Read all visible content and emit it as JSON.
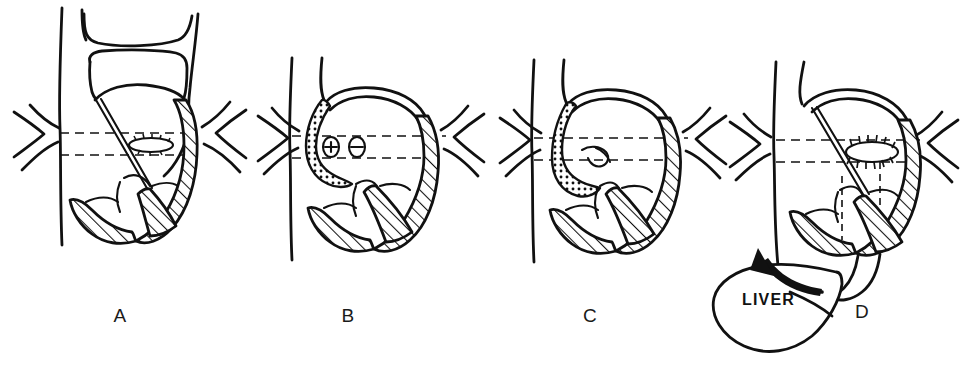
{
  "figure": {
    "type": "medical-surgical-illustration",
    "background_color": "#ffffff",
    "ink_color": "#111111",
    "width": 966,
    "height": 370,
    "panel_count": 4
  },
  "panels": [
    {
      "id": "A",
      "label": "A",
      "label_x": 120,
      "label_y": 322,
      "description": "Esophagus entering hiatus with herniated stomach above diaphragm; hiatal defect shown as small oval, stomach wall cross-hatched",
      "features": [
        "esophagus",
        "diaphragm-chevrons",
        "dashed-hiatus-plane",
        "hiatal-oval-defect",
        "hatched-stomach-wall",
        "herniated-fundus"
      ]
    },
    {
      "id": "B",
      "label": "B",
      "label_x": 348,
      "label_y": 322,
      "description": "Stippled (textured) tube looping through the hiatal plane with two small circular structures shown in the dashed channel",
      "features": [
        "stippled-tube",
        "diaphragm-chevrons",
        "dashed-hiatus-plane",
        "two-small-circles",
        "hatched-stomach-wall"
      ]
    },
    {
      "id": "C",
      "label": "C",
      "label_x": 590,
      "label_y": 322,
      "description": "Stippled tube curled downward, hooked tip visible at the hiatus; stomach wall remains cross-hatched",
      "features": [
        "stippled-tube-curled",
        "hooked-tip",
        "diaphragm-chevrons",
        "dashed-hiatus-plane",
        "hatched-stomach-wall"
      ]
    },
    {
      "id": "D",
      "label": "D",
      "label_x": 862,
      "label_y": 318,
      "description": "Completed repair: sutured hiatus shown as oval with radiating stitch marks, liver retracted away as indicated by the curved arrow",
      "features": [
        "sutured-hiatal-oval",
        "stitch-marks",
        "diaphragm-chevrons",
        "dashed-hiatus-plane",
        "dashed-vertical-guide",
        "hatched-stomach-wall",
        "liver-outline",
        "retraction-arrow"
      ]
    }
  ],
  "annotations": [
    {
      "name": "liver-label",
      "text": "LIVER",
      "x": 742,
      "y": 305,
      "panel": "D"
    }
  ],
  "icons": {
    "retraction_arrow": "curved-arrow-icon",
    "diaphragm_left": "chevron-right-icon",
    "diaphragm_right": "chevron-left-icon"
  }
}
